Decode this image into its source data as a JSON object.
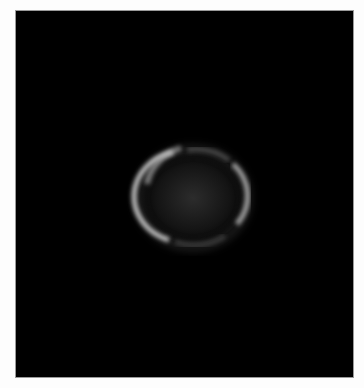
{
  "image": {
    "subject": "ring",
    "background_color": "#000000",
    "frame_border_color": "#9a9a9a",
    "page_background_color": "#fdfdfd",
    "ring_color": "#d8d8d8"
  }
}
